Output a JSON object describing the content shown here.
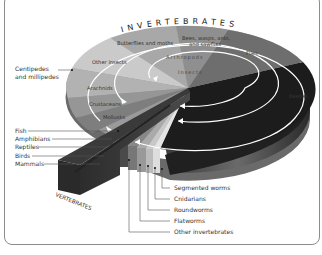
{
  "diagram": {
    "title_arc": "INVERTEBRATES",
    "vertebrates_label": "VERTEBRATES",
    "ring_labels": {
      "arthropods": "Arthropods",
      "insects": "Insects"
    },
    "wedges": [
      {
        "label": "Butterflies and moths",
        "color": "#a8a8a8"
      },
      {
        "label": "Bees, wasps, ants, and sawflies",
        "color": "#8f8f8f"
      },
      {
        "label": "Flies",
        "color": "#6e6e6e"
      },
      {
        "label": "Beetles",
        "color": "#1e1e1e"
      },
      {
        "label": "Other insects",
        "color": "#c8c8c8"
      },
      {
        "label": "Arachnids",
        "color": "#b0b0b0"
      },
      {
        "label": "Crustaceans",
        "color": "#979797"
      },
      {
        "label": "Mollusks",
        "color": "#7f7f7f"
      }
    ],
    "left_labels": [
      {
        "label": "Centipedes and millipedes"
      },
      {
        "label": "Fish"
      },
      {
        "label": "Amphibians"
      },
      {
        "label": "Reptiles"
      },
      {
        "label": "Birds"
      },
      {
        "label": "Mammals"
      }
    ],
    "bottom_labels": [
      {
        "label": "Segmented worms"
      },
      {
        "label": "Cnidarians"
      },
      {
        "label": "Roundworms"
      },
      {
        "label": "Flatworms"
      },
      {
        "label": "Other invertebrates"
      }
    ]
  }
}
